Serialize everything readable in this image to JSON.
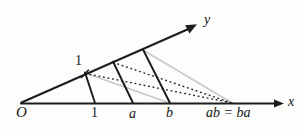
{
  "figure": {
    "kind": "geometric-construction-diagram",
    "background_color": "#fdfdfc",
    "axes": {
      "x_axis_label": "x",
      "y_axis_label": "y",
      "origin_label": "O",
      "axis_color": "#1d1d1d"
    },
    "x_axis_ticks": [
      {
        "label": "1",
        "name": "tick-one"
      },
      {
        "label": "a",
        "name": "tick-a"
      },
      {
        "label": "b",
        "name": "tick-b"
      },
      {
        "label": "ab = ba",
        "name": "tick-product"
      }
    ],
    "y_axis_ticks": [
      {
        "label": "1",
        "name": "tick-unit-on-y"
      }
    ],
    "line_styles": {
      "transversal_color": "#1a1a1a",
      "gray_line_color": "#c9c9c9",
      "dotted_line_color": "#2a2a2a"
    },
    "geometry": {
      "origin": [
        21,
        103
      ],
      "x_axis_end": [
        283,
        104
      ],
      "y_ray_end": [
        196,
        25
      ],
      "x_points": {
        "one": [
          95,
          103
        ],
        "a": [
          133,
          103
        ],
        "b": [
          170,
          103
        ],
        "product": [
          232,
          103
        ]
      },
      "y_points": {
        "unit": [
          85,
          73
        ],
        "second": [
          113,
          62
        ],
        "third": [
          143,
          50
        ]
      },
      "transversals": [
        [
          85,
          73,
          95,
          103
        ],
        [
          113,
          62,
          133,
          103
        ],
        [
          143,
          50,
          170,
          103
        ]
      ],
      "gray_lines": [
        [
          85,
          73,
          170,
          103
        ],
        [
          143,
          50,
          232,
          103
        ]
      ],
      "dotted_lines": [
        [
          85,
          73,
          232,
          103
        ],
        [
          113,
          62,
          232,
          103
        ]
      ]
    }
  }
}
